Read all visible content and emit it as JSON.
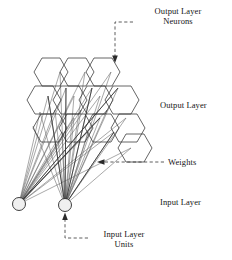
{
  "figure": {
    "title": "",
    "type": "neural-network-diagram",
    "background": "#ffffff",
    "ink": "#1a1a1a"
  },
  "labels": {
    "output_layer_neurons": "Output Layer\nNeurons",
    "output_layer": "Output Layer",
    "weights": "Weights",
    "input_layer": "Input Layer",
    "input_layer_units": "Input Layer\nUnits"
  },
  "annotations": [
    {
      "name": "output-layer-neurons",
      "text": "Output Layer Neurons",
      "arrow_to": "top-right-hexagon",
      "style": "dashed"
    },
    {
      "name": "weights",
      "text": "Weights",
      "arrow_to": "weight-lines",
      "style": "dashed"
    },
    {
      "name": "input-layer-units",
      "text": "Input Layer Units",
      "arrow_to": "right-input-node",
      "style": "dashed"
    }
  ],
  "output_layer": {
    "shape": "hexagon-grid",
    "rows": 3,
    "cols": 3,
    "neuron_count": 9,
    "stroke": "#333333"
  },
  "input_layer": {
    "units": 2,
    "node_fill": "#f0f0f0",
    "node_stroke": "#2a2a2a",
    "nodes": [
      {
        "name": "input-node-1",
        "cx": 19,
        "cy": 204,
        "r": 6.5
      },
      {
        "name": "input-node-2",
        "cx": 65,
        "cy": 205,
        "r": 6.5
      }
    ]
  },
  "weights": {
    "count": 34,
    "stroke": "#555555",
    "description": "fan-out lines from each input unit to output layer hexagon vertices"
  }
}
